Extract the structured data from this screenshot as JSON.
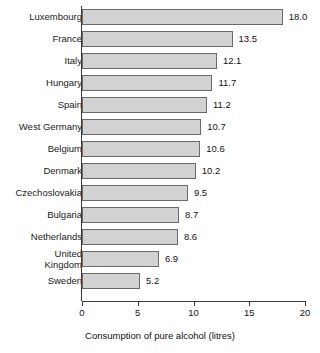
{
  "chart_data": {
    "type": "bar",
    "orientation": "horizontal",
    "title": "",
    "xlabel": "Consumption of pure alcohol (litres)",
    "ylabel": "",
    "xlim": [
      0,
      20
    ],
    "xticks": [
      "0",
      "5",
      "10",
      "15",
      "20"
    ],
    "grid": false,
    "legend": null,
    "categories": [
      "Luxembourg",
      "France",
      "Italy",
      "Hungary",
      "Spain",
      "West Germany",
      "Belgium",
      "Denmark",
      "Czechoslovakia",
      "Bulgaria",
      "Netherlands",
      "United Kingdom",
      "Sweden"
    ],
    "values": [
      18.0,
      13.5,
      12.1,
      11.7,
      11.2,
      10.7,
      10.6,
      10.2,
      9.5,
      8.7,
      8.6,
      6.9,
      5.2
    ],
    "value_labels": [
      "18.0",
      "13.5",
      "12.1",
      "11.7",
      "11.2",
      "10.7",
      "10.6",
      "10.2",
      "9.5",
      "8.7",
      "8.6",
      "6.9",
      "5.2"
    ],
    "category_lines": [
      [
        "Luxembourg"
      ],
      [
        "France"
      ],
      [
        "Italy"
      ],
      [
        "Hungary"
      ],
      [
        "Spain"
      ],
      [
        "West Germany"
      ],
      [
        "Belgium"
      ],
      [
        "Denmark"
      ],
      [
        "Czechoslovakia"
      ],
      [
        "Bulgaria"
      ],
      [
        "Netherlands"
      ],
      [
        "United",
        "Kingdom"
      ],
      [
        "Sweden"
      ]
    ],
    "colors": {
      "bar_fill": "#d2d2d2",
      "bar_border": "#6a6a6a",
      "axis": "#3a3a3a",
      "text": "#111111",
      "background": "#ffffff"
    }
  }
}
